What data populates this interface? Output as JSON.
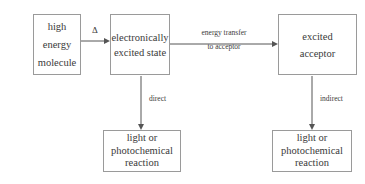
{
  "diagram": {
    "background_color": "#ffffff",
    "box_border_color": "#9a9a9a",
    "text_color": "#3a3a3a",
    "arrow_color": "#555555",
    "boxes": {
      "high_energy_molecule": {
        "line1": "high",
        "line2": "energy",
        "line3": "molecule"
      },
      "electronically_excited_state": {
        "line1": "electronically",
        "line2": "excited state"
      },
      "excited_acceptor": {
        "line1": "excited",
        "line2": "acceptor"
      },
      "direct_product": {
        "line1": "light or",
        "line2": "photochemical",
        "line3": "reaction"
      },
      "indirect_product": {
        "line1": "light or",
        "line2": "photochemical",
        "line3": "reaction"
      }
    },
    "arrow_labels": {
      "heat": "Δ",
      "energy_transfer_line1": "energy transfer",
      "energy_transfer_line2": "to acceptor",
      "direct": "direct",
      "indirect": "indirect"
    }
  }
}
